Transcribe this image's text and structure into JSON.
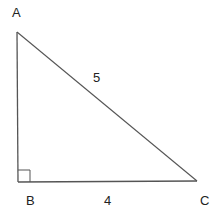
{
  "diagram": {
    "type": "right-triangle",
    "stroke_color": "#555555",
    "vertices": [
      {
        "label": "A",
        "x": 17,
        "y": 32,
        "label_x": 12,
        "label_y": 17
      },
      {
        "label": "B",
        "x": 18,
        "y": 182,
        "label_x": 26,
        "label_y": 205
      },
      {
        "label": "C",
        "x": 197,
        "y": 181,
        "label_x": 204,
        "label_y": 205
      }
    ],
    "sides": [
      {
        "from": "A",
        "to": "C",
        "length_label": "5",
        "label_x": 93,
        "label_y": 82
      },
      {
        "from": "B",
        "to": "C",
        "length_label": "4",
        "label_x": 104,
        "label_y": 205
      },
      {
        "from": "A",
        "to": "B",
        "length_label": ""
      }
    ],
    "right_angle": {
      "at": "B",
      "size": 12
    }
  }
}
